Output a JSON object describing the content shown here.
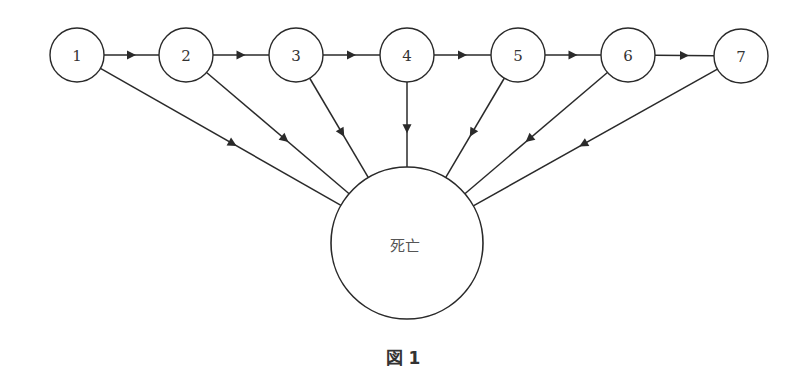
{
  "diagram": {
    "caption": "図 1",
    "stroke_color": "#2a2a2a",
    "states": [
      {
        "id": "1",
        "label": "1",
        "cx": 77,
        "cy": 55
      },
      {
        "id": "2",
        "label": "2",
        "cx": 186,
        "cy": 55
      },
      {
        "id": "3",
        "label": "3",
        "cx": 296,
        "cy": 55
      },
      {
        "id": "4",
        "label": "4",
        "cx": 407,
        "cy": 55
      },
      {
        "id": "5",
        "label": "5",
        "cx": 518,
        "cy": 55
      },
      {
        "id": "6",
        "label": "6",
        "cx": 628,
        "cy": 55
      },
      {
        "id": "7",
        "label": "7",
        "cx": 741,
        "cy": 56
      }
    ],
    "state_radius": 27,
    "absorbing_state": {
      "id": "death",
      "label": "死亡",
      "cx": 407,
      "cy": 243,
      "r": 76
    },
    "transitions": [
      {
        "from": "1",
        "to": "2"
      },
      {
        "from": "2",
        "to": "3"
      },
      {
        "from": "3",
        "to": "4"
      },
      {
        "from": "4",
        "to": "5"
      },
      {
        "from": "5",
        "to": "6"
      },
      {
        "from": "6",
        "to": "7"
      },
      {
        "from": "1",
        "to": "death"
      },
      {
        "from": "2",
        "to": "death"
      },
      {
        "from": "3",
        "to": "death"
      },
      {
        "from": "4",
        "to": "death"
      },
      {
        "from": "5",
        "to": "death"
      },
      {
        "from": "6",
        "to": "death"
      },
      {
        "from": "7",
        "to": "death"
      }
    ]
  }
}
